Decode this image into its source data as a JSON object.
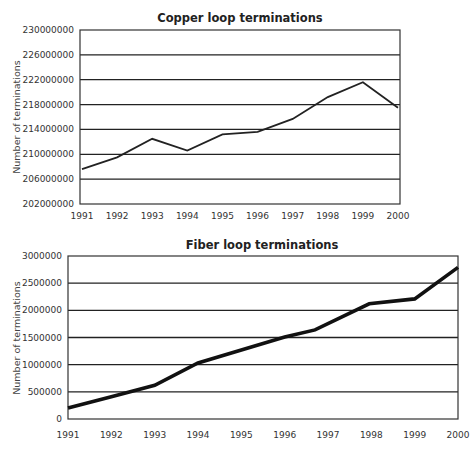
{
  "chart_data": [
    {
      "type": "line",
      "title": "Copper loop terminations",
      "xlabel": "",
      "ylabel": "Number of terminations",
      "x": [
        "1991",
        "1992",
        "1993",
        "1994",
        "1995",
        "1996",
        "1997",
        "1998",
        "1999",
        "2000"
      ],
      "series": [
        {
          "name": "Copper loop terminations",
          "values": [
            207600000,
            209500000,
            212500000,
            210600000,
            213200000,
            213600000,
            215700000,
            219200000,
            221600000,
            217500000
          ]
        }
      ],
      "ylim": [
        202000000,
        230000000
      ],
      "yticks": [
        "202000000",
        "206000000",
        "210000000",
        "214000000",
        "218000000",
        "222000000",
        "226000000",
        "230000000"
      ],
      "grid": true,
      "line_color": "#222222"
    },
    {
      "type": "line",
      "title": "Fiber loop terminations",
      "xlabel": "",
      "ylabel": "Number of terminations",
      "x": [
        "1991",
        "1992",
        "1993",
        "1994",
        "1995",
        "1996",
        "1997",
        "1998",
        "1999",
        "2000"
      ],
      "series": [
        {
          "name": "Fiber loop terminations",
          "points": [
            [
              1991,
              200000
            ],
            [
              1992,
              410000
            ],
            [
              1993,
              620000
            ],
            [
              1994,
              1030000
            ],
            [
              1996,
              1510000
            ],
            [
              1996.7,
              1640000
            ],
            [
              1997.95,
              2120000
            ],
            [
              1999,
              2210000
            ],
            [
              2000,
              2790000
            ]
          ]
        }
      ],
      "ylim": [
        0,
        3000000
      ],
      "yticks": [
        "0",
        "500000",
        "1000000",
        "1500000",
        "2000000",
        "2500000",
        "3000000"
      ],
      "grid": true,
      "line_color": "#111111"
    }
  ]
}
